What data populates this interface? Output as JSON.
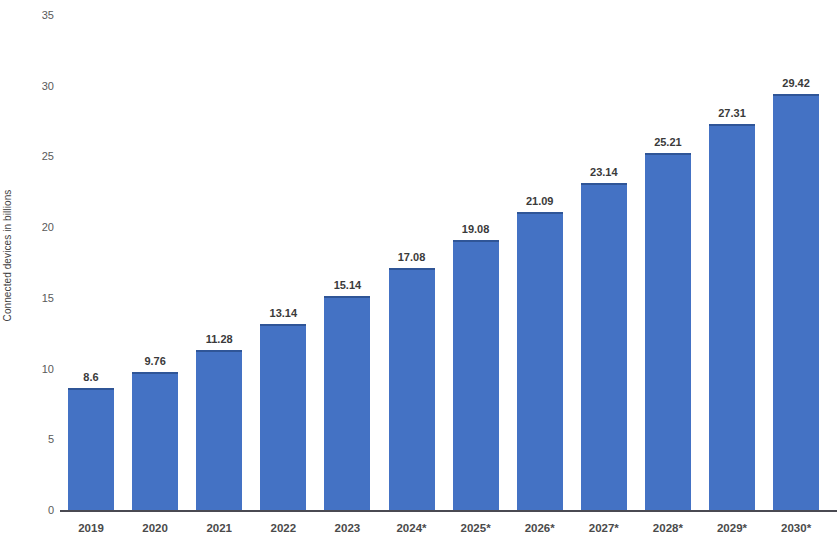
{
  "chart_data": {
    "type": "bar",
    "title": "",
    "subtitle": "",
    "xlabel": "",
    "ylabel": "Connected devices in billions",
    "categories": [
      "2019",
      "2020",
      "2021",
      "2022",
      "2023",
      "2024*",
      "2025*",
      "2026*",
      "2027*",
      "2028*",
      "2029*",
      "2030*"
    ],
    "values": [
      8.6,
      9.76,
      11.28,
      13.14,
      15.14,
      17.08,
      19.08,
      21.09,
      23.14,
      25.21,
      27.31,
      29.42
    ],
    "value_labels": [
      "8.6",
      "9.76",
      "11.28",
      "13.14",
      "15.14",
      "17.08",
      "19.08",
      "21.09",
      "23.14",
      "25.21",
      "27.31",
      "29.42"
    ],
    "ylim": [
      0,
      35
    ],
    "ytick_values": [
      0,
      5,
      10,
      15,
      20,
      25,
      30,
      35
    ],
    "ytick_labels": [
      "0",
      "5",
      "10",
      "15",
      "20",
      "25",
      "30",
      "35"
    ],
    "grid": false,
    "legend": false,
    "legend_position": "none",
    "bar_color": "#4472C4",
    "bar_edge_color": "#2F5597",
    "axis_color": "#4A4A52",
    "label_color": "#3A3A3A",
    "tick_color": "#5A5A5A",
    "background_color": "#FFFFFF",
    "annotations": []
  }
}
